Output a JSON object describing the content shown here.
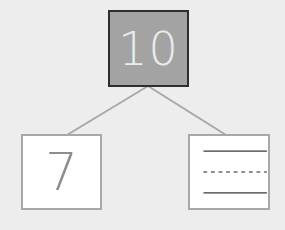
{
  "diagram": {
    "type": "number-bond",
    "whole": {
      "value": "10",
      "fill": "#a3a3a3",
      "border": "#2e2e2e"
    },
    "parts": [
      {
        "value": "7",
        "position": "left"
      },
      {
        "value": "",
        "position": "right",
        "content": "writing-lines",
        "lines": [
          "solid",
          "dashed",
          "solid"
        ]
      }
    ],
    "connector_color": "#a8a8a8",
    "background": "#ededed"
  }
}
